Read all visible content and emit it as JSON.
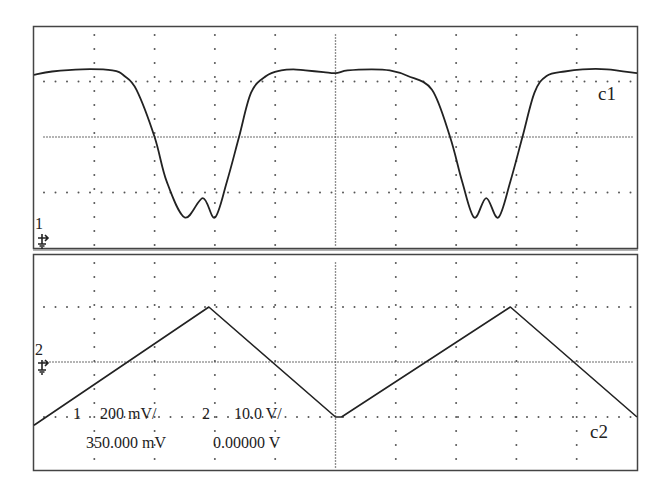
{
  "chart_data": [
    {
      "type": "line",
      "title": "",
      "channel": "1",
      "trace_label": "c1",
      "xlabel": "",
      "ylabel": "",
      "x_divisions": 10,
      "y_divisions": 4,
      "xlim": [
        0,
        10
      ],
      "ylim": [
        -2,
        2
      ],
      "units": "divisions",
      "grid": true,
      "series": [
        {
          "name": "c1",
          "x": [
            0,
            0.3,
            0.8,
            1.3,
            1.5,
            1.7,
            2.0,
            2.2,
            2.5,
            2.8,
            3.0,
            3.2,
            3.4,
            3.6,
            3.85,
            4.1,
            4.3,
            4.5,
            4.8,
            5.0,
            5.2,
            5.6,
            5.9,
            6.2,
            6.6,
            6.9,
            7.1,
            7.3,
            7.5,
            7.7,
            7.9,
            8.1,
            8.3,
            8.5,
            8.8,
            9.1,
            9.5,
            10
          ],
          "y": [
            1.12,
            1.18,
            1.22,
            1.2,
            1.1,
            0.85,
            0.0,
            -0.8,
            -1.45,
            -1.1,
            -1.45,
            -0.8,
            0.0,
            0.8,
            1.1,
            1.2,
            1.22,
            1.2,
            1.17,
            1.15,
            1.2,
            1.22,
            1.2,
            1.1,
            0.85,
            0.0,
            -0.8,
            -1.45,
            -1.1,
            -1.45,
            -0.8,
            0.0,
            0.8,
            1.1,
            1.18,
            1.22,
            1.22,
            1.15
          ]
        }
      ],
      "ground_marker": "1",
      "offset_readout": "350.000 mV",
      "scale_readout": "200 mV/"
    },
    {
      "type": "line",
      "title": "",
      "channel": "2",
      "trace_label": "c2",
      "xlabel": "",
      "ylabel": "",
      "x_divisions": 10,
      "y_divisions": 4,
      "xlim": [
        0,
        10
      ],
      "ylim": [
        -2,
        2
      ],
      "units": "divisions",
      "grid": true,
      "series": [
        {
          "name": "c2",
          "x": [
            0,
            2.9,
            5.0,
            5.1,
            7.9,
            10
          ],
          "y": [
            -1.15,
            1.0,
            -1.0,
            -1.0,
            1.0,
            -1.0
          ]
        }
      ],
      "ground_marker": "2",
      "offset_readout": "0.00000 V",
      "scale_readout": "10.0 V/"
    }
  ],
  "readouts": {
    "ch1_num": "1",
    "ch1_scale": "200 mV/",
    "ch2_num": "2",
    "ch2_scale": "10.0 V/",
    "ch1_offset": "350.000 mV",
    "ch2_offset": "0.00000 V"
  },
  "labels": {
    "c1": "c1",
    "c2": "c2",
    "gnd1": "1",
    "gnd2": "2"
  },
  "colors": {
    "trace": "#222222",
    "grid": "#555555",
    "frame": "#444444"
  }
}
